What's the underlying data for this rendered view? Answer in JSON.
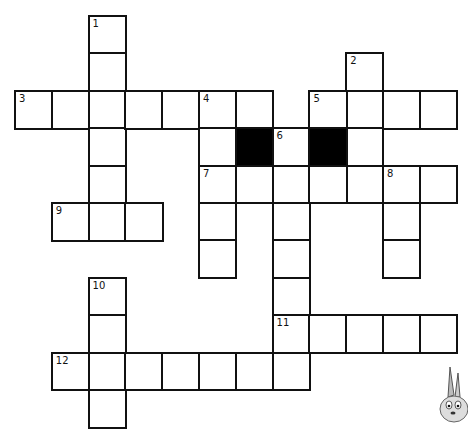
{
  "puzzle": {
    "type": "crossword",
    "grid_origin": {
      "x": 14,
      "y": 15
    },
    "cell_width": 36.8,
    "cell_height": 37.4,
    "colors": {
      "line": "#111111",
      "block": "#000000",
      "background": "#ffffff"
    },
    "clue_numbers": [
      {
        "n": "1",
        "row": 0,
        "col": 2
      },
      {
        "n": "2",
        "row": 1,
        "col": 9
      },
      {
        "n": "3",
        "row": 2,
        "col": 0
      },
      {
        "n": "4",
        "row": 2,
        "col": 5
      },
      {
        "n": "5",
        "row": 2,
        "col": 8
      },
      {
        "n": "6",
        "row": 3,
        "col": 7
      },
      {
        "n": "7",
        "row": 4,
        "col": 5
      },
      {
        "n": "8",
        "row": 4,
        "col": 10
      },
      {
        "n": "9",
        "row": 5,
        "col": 1
      },
      {
        "n": "10",
        "row": 7,
        "col": 2
      },
      {
        "n": "11",
        "row": 8,
        "col": 7
      },
      {
        "n": "12",
        "row": 9,
        "col": 1
      }
    ],
    "entries": [
      {
        "n": "1",
        "dir": "down",
        "row": 0,
        "col": 2,
        "len": 5
      },
      {
        "n": "2",
        "dir": "down",
        "row": 1,
        "col": 9,
        "len": 4
      },
      {
        "n": "3",
        "dir": "across",
        "row": 2,
        "col": 0,
        "len": 7
      },
      {
        "n": "4",
        "dir": "down",
        "row": 2,
        "col": 5,
        "len": 5
      },
      {
        "n": "5",
        "dir": "across",
        "row": 2,
        "col": 8,
        "len": 4
      },
      {
        "n": "6",
        "dir": "down",
        "row": 3,
        "col": 7,
        "len": 7
      },
      {
        "n": "7",
        "dir": "across",
        "row": 4,
        "col": 5,
        "len": 7
      },
      {
        "n": "8",
        "dir": "down",
        "row": 4,
        "col": 10,
        "len": 3
      },
      {
        "n": "9",
        "dir": "across",
        "row": 5,
        "col": 1,
        "len": 3
      },
      {
        "n": "10",
        "dir": "down",
        "row": 7,
        "col": 2,
        "len": 4
      },
      {
        "n": "11",
        "dir": "across",
        "row": 8,
        "col": 7,
        "len": 5
      },
      {
        "n": "12",
        "dir": "across",
        "row": 9,
        "col": 1,
        "len": 7
      }
    ],
    "black_cells": [
      {
        "row": 3,
        "col": 6
      },
      {
        "row": 3,
        "col": 8
      }
    ],
    "decoration": "cartoon-bunny"
  }
}
